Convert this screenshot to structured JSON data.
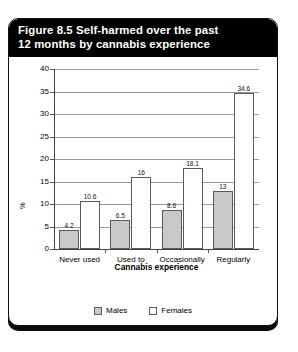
{
  "figure": {
    "title_line1": "Figure 8.5 Self-harmed over the past",
    "title_line2": "12 months by cannabis experience"
  },
  "legend": {
    "position": "bottom-center",
    "items": [
      {
        "label": "Males",
        "swatch": "#c9c9c9"
      },
      {
        "label": "Females",
        "swatch": "#ffffff"
      }
    ]
  },
  "chart_data": {
    "type": "bar",
    "title": "Figure 8.5 Self-harmed over the past 12 months by cannabis experience",
    "xlabel": "Cannabis experience",
    "ylabel": "%",
    "categories": [
      "Never used",
      "Used to",
      "Occasionally",
      "Regularly"
    ],
    "series": [
      {
        "name": "Males",
        "color": "#c9c9c9",
        "values": [
          4.2,
          6.5,
          8.6,
          13
        ]
      },
      {
        "name": "Females",
        "color": "#ffffff",
        "values": [
          10.6,
          16,
          18.1,
          34.6
        ]
      }
    ],
    "ylim": [
      0,
      40
    ],
    "yticks": [
      0,
      5,
      10,
      15,
      20,
      25,
      30,
      35,
      40
    ],
    "ytick_labels": [
      "0",
      "5",
      "10",
      "15",
      "20",
      "25",
      "30",
      "35",
      "40"
    ],
    "grid": "horizontal",
    "data_labels": [
      "4.2",
      "10.6",
      "6.5",
      "16",
      "8.6",
      "18.1",
      "13",
      "34.6"
    ],
    "legend_position": "bottom-center"
  }
}
